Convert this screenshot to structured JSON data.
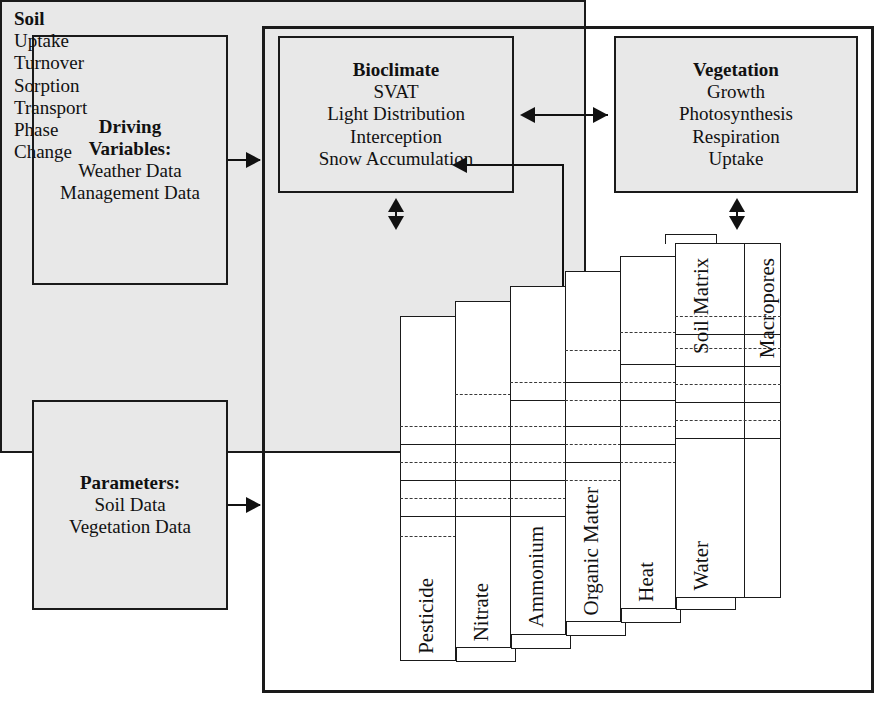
{
  "diagram": {
    "colors": {
      "box_fill": "#e8e8e8",
      "card_fill": "#ffffff",
      "stroke": "#1a1a1a",
      "dash": "#3a3a3a"
    }
  },
  "driving": {
    "title": "Driving",
    "title2": "Variables:",
    "lines": [
      "Weather Data",
      "Management Data"
    ]
  },
  "parameters": {
    "title": "Parameters:",
    "lines": [
      "Soil Data",
      "Vegetation Data"
    ]
  },
  "bioclimate": {
    "title": "Bioclimate",
    "lines": [
      "SVAT",
      "Light Distribution",
      "Interception",
      "Snow Accumulation"
    ]
  },
  "vegetation": {
    "title": "Vegetation",
    "lines": [
      "Growth",
      "Photosynthesis",
      "Respiration",
      "Uptake"
    ]
  },
  "soil": {
    "title": "Soil",
    "lines": [
      "Uptake",
      "Turnover",
      "Sorption",
      "Transport",
      "Phase",
      "Change"
    ],
    "layer_cards": [
      {
        "label": "Pesticide"
      },
      {
        "label": "Nitrate"
      },
      {
        "label": "Ammonium"
      },
      {
        "label": "Organic Matter"
      },
      {
        "label": "Heat"
      },
      {
        "label": "Water"
      }
    ],
    "water_columns": [
      "Soil Matrix",
      "Macropores"
    ],
    "numeric_layer_label_line1": "Numeric",
    "numeric_layer_label_line2": "Layer"
  }
}
